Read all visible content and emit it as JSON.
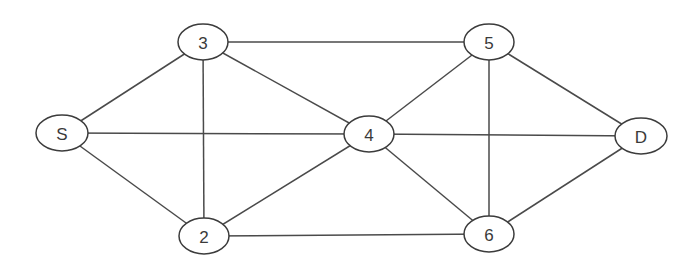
{
  "diagram": {
    "type": "undirected-graph",
    "colors": {
      "edge": "#4a4a4a",
      "node_stroke": "#3c3c3c",
      "node_fill": "#ffffff",
      "label": "#3a3a3a",
      "background": "#ffffff"
    },
    "nodes": [
      {
        "id": "S",
        "label": "S",
        "x": 62,
        "y": 133,
        "rx": 26,
        "ry": 18
      },
      {
        "id": "3",
        "label": "3",
        "x": 203,
        "y": 42,
        "rx": 25,
        "ry": 18
      },
      {
        "id": "2",
        "label": "2",
        "x": 204,
        "y": 236,
        "rx": 25,
        "ry": 18
      },
      {
        "id": "4",
        "label": "4",
        "x": 369,
        "y": 134,
        "rx": 25,
        "ry": 18
      },
      {
        "id": "5",
        "label": "5",
        "x": 489,
        "y": 42,
        "rx": 25,
        "ry": 18
      },
      {
        "id": "6",
        "label": "6",
        "x": 489,
        "y": 234,
        "rx": 25,
        "ry": 18
      },
      {
        "id": "D",
        "label": "D",
        "x": 641,
        "y": 136,
        "rx": 26,
        "ry": 18
      }
    ],
    "edges": [
      {
        "from": "S",
        "to": "3"
      },
      {
        "from": "S",
        "to": "4"
      },
      {
        "from": "S",
        "to": "2"
      },
      {
        "from": "3",
        "to": "5"
      },
      {
        "from": "3",
        "to": "4"
      },
      {
        "from": "3",
        "to": "2"
      },
      {
        "from": "2",
        "to": "4"
      },
      {
        "from": "2",
        "to": "6"
      },
      {
        "from": "4",
        "to": "5"
      },
      {
        "from": "4",
        "to": "D"
      },
      {
        "from": "4",
        "to": "6"
      },
      {
        "from": "5",
        "to": "6"
      },
      {
        "from": "5",
        "to": "D"
      },
      {
        "from": "6",
        "to": "D"
      }
    ]
  }
}
